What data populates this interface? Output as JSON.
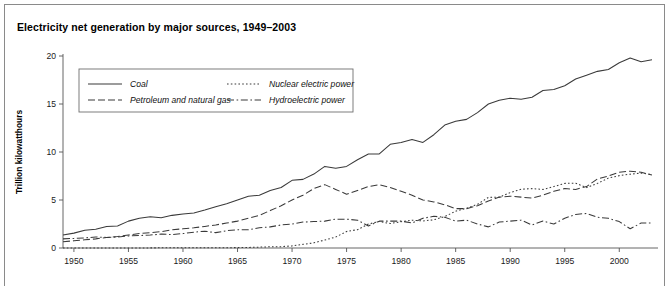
{
  "figure": {
    "title": "Electricity net generation by major sources, 1949–2003",
    "border_color": "#8a8a8a",
    "background": "#ffffff"
  },
  "chart_data": {
    "type": "line",
    "title": "Electricity net generation by major sources, 1949–2003",
    "xlabel": "",
    "ylabel": "Trillion kilowatthours",
    "xlim": [
      1949,
      2003
    ],
    "ylim": [
      0,
      20
    ],
    "grid": false,
    "legend_position": "top-left-inside",
    "xticks": [
      1950,
      1955,
      1960,
      1965,
      1970,
      1975,
      1980,
      1985,
      1990,
      1995,
      2000
    ],
    "xtick_labels": [
      "1950",
      "1955",
      "1960",
      "1965",
      "1970",
      "1975",
      "1980",
      "1985",
      "1990",
      "1995",
      "2000"
    ],
    "yticks": [
      0,
      5,
      10,
      15,
      20
    ],
    "ytick_labels": [
      "0",
      "5",
      "10",
      "15",
      "20"
    ],
    "x": [
      1949,
      1950,
      1951,
      1952,
      1953,
      1954,
      1955,
      1956,
      1957,
      1958,
      1959,
      1960,
      1961,
      1962,
      1963,
      1964,
      1965,
      1966,
      1967,
      1968,
      1969,
      1970,
      1971,
      1972,
      1973,
      1974,
      1975,
      1976,
      1977,
      1978,
      1979,
      1980,
      1981,
      1982,
      1983,
      1984,
      1985,
      1986,
      1987,
      1988,
      1989,
      1990,
      1991,
      1992,
      1993,
      1994,
      1995,
      1996,
      1997,
      1998,
      1999,
      2000,
      2001,
      2002,
      2003
    ],
    "series": [
      {
        "name": "Coal",
        "line_style": "solid",
        "color": "#3a3a3a",
        "values": [
          1.35,
          1.55,
          1.85,
          1.95,
          2.25,
          2.3,
          2.8,
          3.1,
          3.25,
          3.15,
          3.4,
          3.55,
          3.65,
          3.95,
          4.3,
          4.6,
          5.0,
          5.4,
          5.5,
          6.0,
          6.3,
          7.05,
          7.15,
          7.7,
          8.5,
          8.3,
          8.5,
          9.2,
          9.8,
          9.8,
          10.8,
          11.0,
          11.3,
          11.0,
          11.8,
          12.8,
          13.2,
          13.4,
          14.1,
          15.0,
          15.4,
          15.6,
          15.5,
          15.7,
          16.4,
          16.5,
          16.9,
          17.6,
          18.0,
          18.4,
          18.6,
          19.3,
          19.8,
          19.4,
          19.6
        ]
      },
      {
        "name": "Petroleum and natural gas",
        "line_style": "dashed",
        "color": "#3a3a3a",
        "values": [
          0.65,
          0.75,
          0.85,
          0.95,
          1.1,
          1.2,
          1.35,
          1.5,
          1.6,
          1.7,
          1.9,
          2.0,
          2.1,
          2.25,
          2.4,
          2.6,
          2.8,
          3.1,
          3.4,
          3.9,
          4.4,
          5.0,
          5.5,
          6.2,
          6.6,
          6.1,
          5.6,
          6.0,
          6.4,
          6.6,
          6.3,
          5.9,
          5.5,
          5.0,
          4.8,
          4.5,
          4.1,
          4.1,
          4.4,
          4.9,
          5.3,
          5.4,
          5.3,
          5.2,
          5.5,
          5.9,
          6.2,
          6.1,
          6.4,
          7.2,
          7.5,
          7.9,
          8.0,
          7.9,
          7.6
        ]
      },
      {
        "name": "Nuclear electric power",
        "line_style": "dotted",
        "color": "#3a3a3a",
        "values": [
          0.0,
          0.0,
          0.0,
          0.0,
          0.0,
          0.0,
          0.0,
          0.0,
          0.01,
          0.02,
          0.02,
          0.02,
          0.02,
          0.02,
          0.03,
          0.03,
          0.04,
          0.06,
          0.09,
          0.13,
          0.14,
          0.22,
          0.38,
          0.54,
          0.83,
          1.14,
          1.72,
          1.91,
          2.5,
          2.76,
          2.55,
          2.74,
          2.9,
          2.82,
          2.94,
          3.27,
          3.84,
          4.15,
          4.55,
          5.27,
          5.29,
          5.77,
          6.12,
          6.19,
          6.1,
          6.4,
          6.73,
          6.75,
          6.29,
          6.73,
          7.28,
          7.54,
          7.69,
          7.8,
          7.64
        ]
      },
      {
        "name": "Hydroelectric power",
        "line_style": "dashdot",
        "color": "#3a3a3a",
        "values": [
          0.95,
          1.0,
          1.05,
          1.15,
          1.1,
          1.15,
          1.25,
          1.3,
          1.35,
          1.45,
          1.4,
          1.5,
          1.65,
          1.75,
          1.6,
          1.8,
          1.9,
          1.9,
          2.1,
          2.2,
          2.4,
          2.5,
          2.7,
          2.75,
          2.8,
          3.0,
          3.0,
          2.9,
          2.3,
          2.8,
          2.8,
          2.8,
          2.6,
          3.1,
          3.3,
          3.2,
          2.8,
          2.9,
          2.5,
          2.2,
          2.7,
          2.8,
          2.9,
          2.4,
          2.8,
          2.5,
          3.1,
          3.5,
          3.6,
          3.2,
          3.1,
          2.75,
          2.0,
          2.6,
          2.6
        ]
      }
    ]
  },
  "legend": {
    "entries": [
      {
        "label": "Coal",
        "style": "solid"
      },
      {
        "label": "Petroleum and natural gas",
        "style": "dashed"
      },
      {
        "label": "Nuclear electric power",
        "style": "dotted"
      },
      {
        "label": "Hydroelectric power",
        "style": "dashdot"
      }
    ]
  }
}
